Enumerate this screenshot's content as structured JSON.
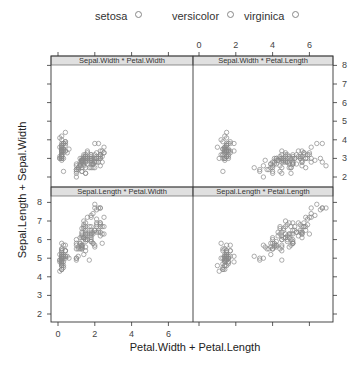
{
  "chart_data": {
    "type": "scatter",
    "layout": "lattice 2x2 extended-formula xyplot",
    "xlabel": "Petal.Width + Petal.Length",
    "ylabel": "Sepal.Length + Sepal.Width",
    "legend": {
      "position": "top",
      "entries": [
        "setosa",
        "versicolor",
        "virginica"
      ],
      "symbol": "open circle",
      "color": "#888888"
    },
    "x_ticks": [
      0,
      2,
      4,
      6
    ],
    "y_ticks": [
      2,
      3,
      4,
      5,
      6,
      7,
      8
    ],
    "xlim": [
      -0.3,
      7.3
    ],
    "ylim": [
      1.6,
      8.5
    ],
    "grid": false,
    "panels": [
      {
        "strip": "Sepal.Width * Petal.Width",
        "x_var": "Petal.Width",
        "y_var": "Sepal.Width",
        "position": "top-left"
      },
      {
        "strip": "Sepal.Width * Petal.Length",
        "x_var": "Petal.Length",
        "y_var": "Sepal.Width",
        "position": "top-right"
      },
      {
        "strip": "Sepal.Length * Petal.Width",
        "x_var": "Petal.Width",
        "y_var": "Sepal.Length",
        "position": "bottom-left"
      },
      {
        "strip": "Sepal.Length * Petal.Length",
        "x_var": "Petal.Length",
        "y_var": "Sepal.Length",
        "position": "bottom-right"
      }
    ],
    "columns": [
      "Sepal.Length",
      "Sepal.Width",
      "Petal.Length",
      "Petal.Width",
      "Species"
    ],
    "rows": [
      [
        5.1,
        3.5,
        1.4,
        0.2,
        "setosa"
      ],
      [
        4.9,
        3.0,
        1.4,
        0.2,
        "setosa"
      ],
      [
        4.7,
        3.2,
        1.3,
        0.2,
        "setosa"
      ],
      [
        4.6,
        3.1,
        1.5,
        0.2,
        "setosa"
      ],
      [
        5.0,
        3.6,
        1.4,
        0.2,
        "setosa"
      ],
      [
        5.4,
        3.9,
        1.7,
        0.4,
        "setosa"
      ],
      [
        4.6,
        3.4,
        1.4,
        0.3,
        "setosa"
      ],
      [
        5.0,
        3.4,
        1.5,
        0.2,
        "setosa"
      ],
      [
        4.4,
        2.9,
        1.4,
        0.2,
        "setosa"
      ],
      [
        4.9,
        3.1,
        1.5,
        0.1,
        "setosa"
      ],
      [
        5.4,
        3.7,
        1.5,
        0.2,
        "setosa"
      ],
      [
        4.8,
        3.4,
        1.6,
        0.2,
        "setosa"
      ],
      [
        4.8,
        3.0,
        1.4,
        0.1,
        "setosa"
      ],
      [
        4.3,
        3.0,
        1.1,
        0.1,
        "setosa"
      ],
      [
        5.8,
        4.0,
        1.2,
        0.2,
        "setosa"
      ],
      [
        5.7,
        4.4,
        1.5,
        0.4,
        "setosa"
      ],
      [
        5.4,
        3.9,
        1.3,
        0.4,
        "setosa"
      ],
      [
        5.1,
        3.5,
        1.4,
        0.3,
        "setosa"
      ],
      [
        5.7,
        3.8,
        1.7,
        0.3,
        "setosa"
      ],
      [
        5.1,
        3.8,
        1.5,
        0.3,
        "setosa"
      ],
      [
        5.4,
        3.4,
        1.7,
        0.2,
        "setosa"
      ],
      [
        5.1,
        3.7,
        1.5,
        0.4,
        "setosa"
      ],
      [
        4.6,
        3.6,
        1.0,
        0.2,
        "setosa"
      ],
      [
        5.1,
        3.3,
        1.7,
        0.5,
        "setosa"
      ],
      [
        4.8,
        3.4,
        1.9,
        0.2,
        "setosa"
      ],
      [
        5.0,
        3.0,
        1.6,
        0.2,
        "setosa"
      ],
      [
        5.0,
        3.4,
        1.6,
        0.4,
        "setosa"
      ],
      [
        5.2,
        3.5,
        1.5,
        0.2,
        "setosa"
      ],
      [
        5.2,
        3.4,
        1.4,
        0.2,
        "setosa"
      ],
      [
        4.7,
        3.2,
        1.6,
        0.2,
        "setosa"
      ],
      [
        4.8,
        3.1,
        1.6,
        0.2,
        "setosa"
      ],
      [
        5.4,
        3.4,
        1.5,
        0.4,
        "setosa"
      ],
      [
        5.2,
        4.1,
        1.5,
        0.1,
        "setosa"
      ],
      [
        5.5,
        4.2,
        1.4,
        0.2,
        "setosa"
      ],
      [
        4.9,
        3.1,
        1.5,
        0.2,
        "setosa"
      ],
      [
        5.0,
        3.2,
        1.2,
        0.2,
        "setosa"
      ],
      [
        5.5,
        3.5,
        1.3,
        0.2,
        "setosa"
      ],
      [
        4.9,
        3.6,
        1.4,
        0.1,
        "setosa"
      ],
      [
        4.4,
        3.0,
        1.3,
        0.2,
        "setosa"
      ],
      [
        5.1,
        3.4,
        1.5,
        0.2,
        "setosa"
      ],
      [
        5.0,
        3.5,
        1.3,
        0.3,
        "setosa"
      ],
      [
        4.5,
        2.3,
        1.3,
        0.3,
        "setosa"
      ],
      [
        4.4,
        3.2,
        1.3,
        0.2,
        "setosa"
      ],
      [
        5.0,
        3.5,
        1.6,
        0.6,
        "setosa"
      ],
      [
        5.1,
        3.8,
        1.9,
        0.4,
        "setosa"
      ],
      [
        4.8,
        3.0,
        1.4,
        0.3,
        "setosa"
      ],
      [
        5.1,
        3.8,
        1.6,
        0.2,
        "setosa"
      ],
      [
        4.6,
        3.2,
        1.4,
        0.2,
        "setosa"
      ],
      [
        5.3,
        3.7,
        1.5,
        0.2,
        "setosa"
      ],
      [
        5.0,
        3.3,
        1.4,
        0.2,
        "setosa"
      ],
      [
        7.0,
        3.2,
        4.7,
        1.4,
        "versicolor"
      ],
      [
        6.4,
        3.2,
        4.5,
        1.5,
        "versicolor"
      ],
      [
        6.9,
        3.1,
        4.9,
        1.5,
        "versicolor"
      ],
      [
        5.5,
        2.3,
        4.0,
        1.3,
        "versicolor"
      ],
      [
        6.5,
        2.8,
        4.6,
        1.5,
        "versicolor"
      ],
      [
        5.7,
        2.8,
        4.5,
        1.3,
        "versicolor"
      ],
      [
        6.3,
        3.3,
        4.7,
        1.6,
        "versicolor"
      ],
      [
        4.9,
        2.4,
        3.3,
        1.0,
        "versicolor"
      ],
      [
        6.6,
        2.9,
        4.6,
        1.3,
        "versicolor"
      ],
      [
        5.2,
        2.7,
        3.9,
        1.4,
        "versicolor"
      ],
      [
        5.0,
        2.0,
        3.5,
        1.0,
        "versicolor"
      ],
      [
        5.9,
        3.0,
        4.2,
        1.5,
        "versicolor"
      ],
      [
        6.0,
        2.2,
        4.0,
        1.0,
        "versicolor"
      ],
      [
        6.1,
        2.9,
        4.7,
        1.4,
        "versicolor"
      ],
      [
        5.6,
        2.9,
        3.6,
        1.3,
        "versicolor"
      ],
      [
        6.7,
        3.1,
        4.4,
        1.4,
        "versicolor"
      ],
      [
        5.6,
        3.0,
        4.5,
        1.5,
        "versicolor"
      ],
      [
        5.8,
        2.7,
        4.1,
        1.0,
        "versicolor"
      ],
      [
        6.2,
        2.2,
        4.5,
        1.5,
        "versicolor"
      ],
      [
        5.6,
        2.5,
        3.9,
        1.1,
        "versicolor"
      ],
      [
        5.9,
        3.2,
        4.8,
        1.8,
        "versicolor"
      ],
      [
        6.1,
        2.8,
        4.0,
        1.3,
        "versicolor"
      ],
      [
        6.3,
        2.5,
        4.9,
        1.5,
        "versicolor"
      ],
      [
        6.1,
        2.8,
        4.7,
        1.2,
        "versicolor"
      ],
      [
        6.4,
        2.9,
        4.3,
        1.3,
        "versicolor"
      ],
      [
        6.6,
        3.0,
        4.4,
        1.4,
        "versicolor"
      ],
      [
        6.8,
        2.8,
        4.8,
        1.4,
        "versicolor"
      ],
      [
        6.7,
        3.0,
        5.0,
        1.7,
        "versicolor"
      ],
      [
        6.0,
        2.9,
        4.5,
        1.5,
        "versicolor"
      ],
      [
        5.7,
        2.6,
        3.5,
        1.0,
        "versicolor"
      ],
      [
        5.5,
        2.4,
        3.8,
        1.1,
        "versicolor"
      ],
      [
        5.5,
        2.4,
        3.7,
        1.0,
        "versicolor"
      ],
      [
        5.8,
        2.7,
        3.9,
        1.2,
        "versicolor"
      ],
      [
        6.0,
        2.7,
        5.1,
        1.6,
        "versicolor"
      ],
      [
        5.4,
        3.0,
        4.5,
        1.5,
        "versicolor"
      ],
      [
        6.0,
        3.4,
        4.5,
        1.6,
        "versicolor"
      ],
      [
        6.7,
        3.1,
        4.7,
        1.5,
        "versicolor"
      ],
      [
        6.3,
        2.3,
        4.4,
        1.3,
        "versicolor"
      ],
      [
        5.6,
        3.0,
        4.1,
        1.3,
        "versicolor"
      ],
      [
        5.5,
        2.5,
        4.0,
        1.3,
        "versicolor"
      ],
      [
        5.5,
        2.6,
        4.4,
        1.2,
        "versicolor"
      ],
      [
        6.1,
        3.0,
        4.6,
        1.4,
        "versicolor"
      ],
      [
        5.8,
        2.6,
        4.0,
        1.2,
        "versicolor"
      ],
      [
        5.0,
        2.3,
        3.3,
        1.0,
        "versicolor"
      ],
      [
        5.6,
        2.7,
        4.2,
        1.3,
        "versicolor"
      ],
      [
        5.7,
        3.0,
        4.2,
        1.2,
        "versicolor"
      ],
      [
        5.7,
        2.9,
        4.2,
        1.3,
        "versicolor"
      ],
      [
        6.2,
        2.9,
        4.3,
        1.3,
        "versicolor"
      ],
      [
        5.1,
        2.5,
        3.0,
        1.1,
        "versicolor"
      ],
      [
        5.7,
        2.8,
        4.1,
        1.3,
        "versicolor"
      ],
      [
        6.3,
        3.3,
        6.0,
        2.5,
        "virginica"
      ],
      [
        5.8,
        2.7,
        5.1,
        1.9,
        "virginica"
      ],
      [
        7.1,
        3.0,
        5.9,
        2.1,
        "virginica"
      ],
      [
        6.3,
        2.9,
        5.6,
        1.8,
        "virginica"
      ],
      [
        6.5,
        3.0,
        5.8,
        2.2,
        "virginica"
      ],
      [
        7.6,
        3.0,
        6.6,
        2.1,
        "virginica"
      ],
      [
        4.9,
        2.5,
        4.5,
        1.7,
        "virginica"
      ],
      [
        7.3,
        2.9,
        6.3,
        1.8,
        "virginica"
      ],
      [
        6.7,
        2.5,
        5.8,
        1.8,
        "virginica"
      ],
      [
        7.2,
        3.6,
        6.1,
        2.5,
        "virginica"
      ],
      [
        6.5,
        3.2,
        5.1,
        2.0,
        "virginica"
      ],
      [
        6.4,
        2.7,
        5.3,
        1.9,
        "virginica"
      ],
      [
        6.8,
        3.0,
        5.5,
        2.1,
        "virginica"
      ],
      [
        5.7,
        2.5,
        5.0,
        2.0,
        "virginica"
      ],
      [
        5.8,
        2.8,
        5.1,
        2.4,
        "virginica"
      ],
      [
        6.4,
        3.2,
        5.3,
        2.3,
        "virginica"
      ],
      [
        6.5,
        3.0,
        5.5,
        1.8,
        "virginica"
      ],
      [
        7.7,
        3.8,
        6.7,
        2.2,
        "virginica"
      ],
      [
        7.7,
        2.6,
        6.9,
        2.3,
        "virginica"
      ],
      [
        6.0,
        2.2,
        5.0,
        1.5,
        "virginica"
      ],
      [
        6.9,
        3.2,
        5.7,
        2.3,
        "virginica"
      ],
      [
        5.6,
        2.8,
        4.9,
        2.0,
        "virginica"
      ],
      [
        7.7,
        2.8,
        6.7,
        2.0,
        "virginica"
      ],
      [
        6.3,
        2.7,
        4.9,
        1.8,
        "virginica"
      ],
      [
        6.7,
        3.3,
        5.7,
        2.1,
        "virginica"
      ],
      [
        7.2,
        3.2,
        6.0,
        1.8,
        "virginica"
      ],
      [
        6.2,
        2.8,
        4.8,
        1.8,
        "virginica"
      ],
      [
        6.1,
        3.0,
        4.9,
        1.8,
        "virginica"
      ],
      [
        6.4,
        2.8,
        5.6,
        2.1,
        "virginica"
      ],
      [
        7.2,
        3.0,
        5.8,
        1.6,
        "virginica"
      ],
      [
        7.4,
        2.8,
        6.1,
        1.9,
        "virginica"
      ],
      [
        7.9,
        3.8,
        6.4,
        2.0,
        "virginica"
      ],
      [
        6.4,
        2.8,
        5.6,
        2.2,
        "virginica"
      ],
      [
        6.3,
        2.8,
        5.1,
        1.5,
        "virginica"
      ],
      [
        6.1,
        2.6,
        5.6,
        1.4,
        "virginica"
      ],
      [
        7.7,
        3.0,
        6.1,
        2.3,
        "virginica"
      ],
      [
        6.3,
        3.4,
        5.6,
        2.4,
        "virginica"
      ],
      [
        6.4,
        3.1,
        5.5,
        1.8,
        "virginica"
      ],
      [
        6.0,
        3.0,
        4.8,
        1.8,
        "virginica"
      ],
      [
        6.9,
        3.1,
        5.4,
        2.1,
        "virginica"
      ],
      [
        6.7,
        3.1,
        5.6,
        2.4,
        "virginica"
      ],
      [
        6.9,
        3.1,
        5.1,
        2.3,
        "virginica"
      ],
      [
        5.8,
        2.7,
        5.1,
        1.9,
        "virginica"
      ],
      [
        6.8,
        3.2,
        5.9,
        2.3,
        "virginica"
      ],
      [
        6.7,
        3.3,
        5.7,
        2.5,
        "virginica"
      ],
      [
        6.7,
        3.0,
        5.2,
        2.3,
        "virginica"
      ],
      [
        6.3,
        2.5,
        5.0,
        1.9,
        "virginica"
      ],
      [
        6.5,
        3.0,
        5.2,
        2.0,
        "virginica"
      ],
      [
        6.2,
        3.4,
        5.4,
        2.3,
        "virginica"
      ],
      [
        5.9,
        3.0,
        5.1,
        1.8,
        "virginica"
      ]
    ]
  },
  "style": {
    "point_color": "#8a8a8a",
    "frame_color": "#333333",
    "strip_fill": "#e0e0e0",
    "strip_border": "#777777",
    "tick_label_color": "#444444"
  }
}
